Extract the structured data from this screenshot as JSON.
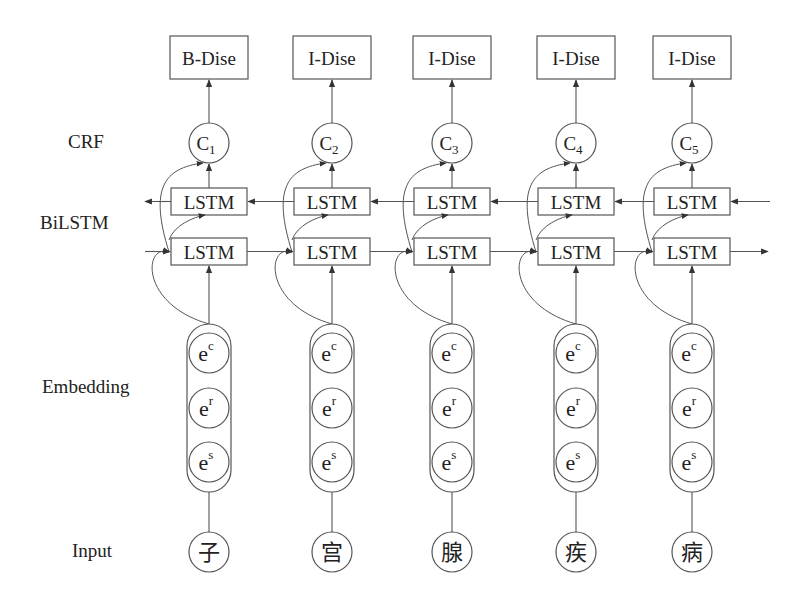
{
  "row_labels": {
    "crf": "CRF",
    "bilstm": "BiLSTM",
    "embedding": "Embedding",
    "input": "Input"
  },
  "columns": [
    {
      "tag": "B-Dise",
      "crf": "C",
      "crf_sub": "1",
      "lstm_backward": "LSTM",
      "lstm_forward": "LSTM",
      "emb": [
        {
          "base": "e",
          "sup": "c"
        },
        {
          "base": "e",
          "sup": "r"
        },
        {
          "base": "e",
          "sup": "s"
        }
      ],
      "input": "子"
    },
    {
      "tag": "I-Dise",
      "crf": "C",
      "crf_sub": "2",
      "lstm_backward": "LSTM",
      "lstm_forward": "LSTM",
      "emb": [
        {
          "base": "e",
          "sup": "c"
        },
        {
          "base": "e",
          "sup": "r"
        },
        {
          "base": "e",
          "sup": "s"
        }
      ],
      "input": "宫"
    },
    {
      "tag": "I-Dise",
      "crf": "C",
      "crf_sub": "3",
      "lstm_backward": "LSTM",
      "lstm_forward": "LSTM",
      "emb": [
        {
          "base": "e",
          "sup": "c"
        },
        {
          "base": "e",
          "sup": "r"
        },
        {
          "base": "e",
          "sup": "s"
        }
      ],
      "input": "腺"
    },
    {
      "tag": "I-Dise",
      "crf": "C",
      "crf_sub": "4",
      "lstm_backward": "LSTM",
      "lstm_forward": "LSTM",
      "emb": [
        {
          "base": "e",
          "sup": "c"
        },
        {
          "base": "e",
          "sup": "r"
        },
        {
          "base": "e",
          "sup": "s"
        }
      ],
      "input": "疾"
    },
    {
      "tag": "I-Dise",
      "crf": "C",
      "crf_sub": "5",
      "lstm_backward": "LSTM",
      "lstm_forward": "LSTM",
      "emb": [
        {
          "base": "e",
          "sup": "c"
        },
        {
          "base": "e",
          "sup": "r"
        },
        {
          "base": "e",
          "sup": "s"
        }
      ],
      "input": "病"
    }
  ],
  "colors": {
    "stroke": "#555555",
    "text": "#222222",
    "background": "#ffffff"
  }
}
